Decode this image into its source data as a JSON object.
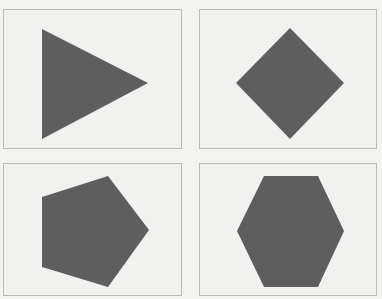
{
  "figure": {
    "layout": "2x2 grid",
    "shape_color": "#5e5e5e",
    "panel_border_color": "#b9b9b7",
    "background_color": "#f1f1ef",
    "panels": [
      {
        "shape": "triangle",
        "sides": 3,
        "orientation": "pointing-right",
        "points": "38,19 144,73 38,129"
      },
      {
        "shape": "diamond",
        "sides": 4,
        "orientation": "rotated-square",
        "points": "90,18 144,73 90,129 36,73"
      },
      {
        "shape": "pentagon",
        "sides": 5,
        "orientation": "pointing-right",
        "points": "104,12 145,66 104,123 38,103 38,33"
      },
      {
        "shape": "hexagon",
        "sides": 6,
        "orientation": "flat-top",
        "points": "64,12 118,12 144,67 118,123 64,123 37,67"
      }
    ]
  }
}
